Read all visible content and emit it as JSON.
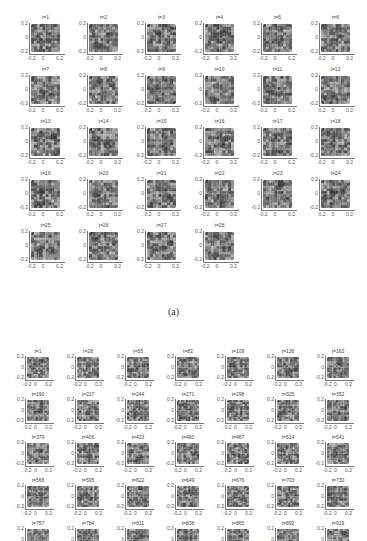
{
  "figure": {
    "panel_a": {
      "label": "(a)",
      "columns": 6,
      "titles": [
        "t=1",
        "t=2",
        "t=3",
        "t=4",
        "t=5",
        "t=6",
        "t=7",
        "t=8",
        "t=9",
        "t=10",
        "t=11",
        "t=12",
        "t=13",
        "t=14",
        "t=15",
        "t=16",
        "t=17",
        "t=18",
        "t=19",
        "t=20",
        "t=21",
        "t=22",
        "t=23",
        "t=24",
        "t=25",
        "t=26",
        "t=27",
        "t=28"
      ]
    },
    "panel_b": {
      "label": "(b)",
      "columns": 7,
      "titles": [
        "t=1",
        "t=28",
        "t=55",
        "t=82",
        "t=109",
        "t=136",
        "t=163",
        "t=190",
        "t=217",
        "t=244",
        "t=271",
        "t=298",
        "t=325",
        "t=352",
        "t=379",
        "t=406",
        "t=433",
        "t=460",
        "t=487",
        "t=514",
        "t=541",
        "t=568",
        "t=595",
        "t=622",
        "t=649",
        "t=676",
        "t=703",
        "t=730",
        "t=757",
        "t=784",
        "t=811",
        "t=838",
        "t=865",
        "t=892",
        "t=919"
      ]
    },
    "axes": {
      "yticks": [
        "0.2",
        "0",
        "-0.2"
      ],
      "xticks": [
        "-0.2",
        "0",
        "0.2"
      ]
    }
  }
}
